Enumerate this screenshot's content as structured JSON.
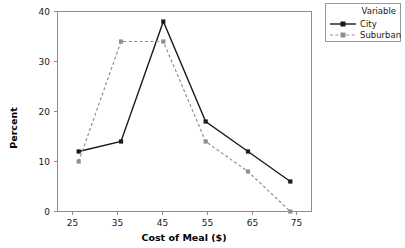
{
  "chart_data": {
    "type": "line",
    "title": "",
    "xlabel": "Cost of Meal ($)",
    "ylabel": "Percent",
    "x": [
      25,
      35,
      45,
      55,
      65,
      75
    ],
    "xticklabels": [
      "25",
      "35",
      "45",
      "55",
      "65",
      "75"
    ],
    "yticklabels": [
      "0",
      "10",
      "20",
      "30",
      "40"
    ],
    "yticks": [
      0,
      10,
      20,
      30,
      40
    ],
    "xlim": [
      20,
      80
    ],
    "ylim": [
      0,
      40
    ],
    "grid": false,
    "legend": {
      "position": "top-right-outside",
      "title": "Variable",
      "entries": [
        "City",
        "Suburban"
      ]
    },
    "series": [
      {
        "name": "City",
        "values": [
          12,
          14,
          38,
          18,
          12,
          6
        ],
        "color": "#1a1a1a",
        "linestyle": "solid",
        "marker": "square"
      },
      {
        "name": "Suburban",
        "values": [
          10,
          34,
          34,
          14,
          8,
          0
        ],
        "color": "#8f8f8f",
        "linestyle": "dashed",
        "marker": "square"
      }
    ]
  },
  "axes": {
    "x_title": "Cost of Meal ($)",
    "y_title": "Percent"
  },
  "colors": {
    "city": "#1a1a1a",
    "suburban": "#8f8f8f",
    "frame": "#8c8c8c",
    "background": "#ffffff"
  }
}
